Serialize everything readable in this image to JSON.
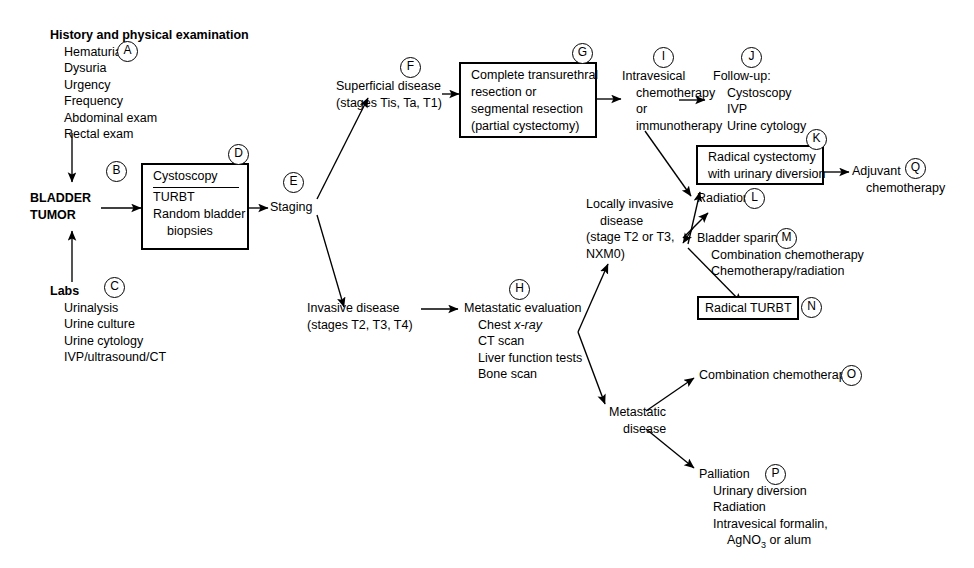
{
  "diagram": {
    "labels": {
      "A": "A",
      "B": "B",
      "C": "C",
      "D": "D",
      "E": "E",
      "F": "F",
      "G": "G",
      "H": "H",
      "I": "I",
      "J": "J",
      "K": "K",
      "L": "L",
      "M": "M",
      "N": "N",
      "O": "O",
      "P": "P",
      "Q": "Q"
    },
    "nodes": {
      "history": {
        "heading": "History and physical examination",
        "items": [
          "Hematuria",
          "Dysuria",
          "Urgency",
          "Frequency",
          "Abdominal exam",
          "Rectal exam"
        ]
      },
      "bladder_tumor": {
        "line1": "BLADDER",
        "line2": "TUMOR"
      },
      "labs": {
        "heading": "Labs",
        "items": [
          "Urinalysis",
          "Urine culture",
          "Urine cytology",
          "IVP/ultrasound/CT"
        ]
      },
      "cystoscopy_box": {
        "line1": "Cystoscopy",
        "line2": "TURBT",
        "line3": "Random bladder",
        "line4": "biopsies"
      },
      "staging": {
        "label": "Staging"
      },
      "superficial": {
        "line1": "Superficial disease",
        "line2": "(stages Tis, Ta, T1)"
      },
      "resection_box": {
        "line1": "Complete transurethral",
        "line2": "resection or",
        "line3": "segmental resection",
        "line4": "(partial cystectomy)"
      },
      "intravesical": {
        "line1": "Intravesical",
        "line2": "chemotherapy",
        "line3": "or",
        "line4": "immunotherapy"
      },
      "followup": {
        "heading": "Follow-up:",
        "items": [
          "Cystoscopy",
          "IVP",
          "Urine cytology"
        ]
      },
      "invasive": {
        "line1": "Invasive disease",
        "line2": "(stages T2, T3, T4)"
      },
      "metastatic_eval": {
        "heading": "Metastatic evaluation",
        "items": [
          "Chest x-ray",
          "CT scan",
          "Liver function tests",
          "Bone scan"
        ],
        "chest_pre": "Chest ",
        "chest_ital": "x-ray"
      },
      "locally_invasive": {
        "line1": "Locally invasive",
        "line2": "disease",
        "line3": "(stage T2 or T3,",
        "line4": "NXM0)"
      },
      "cystectomy_box": {
        "line1": "Radical cystectomy",
        "line2": "with urinary diversion"
      },
      "adjuvant": {
        "line1": "Adjuvant",
        "line2": "chemotherapy"
      },
      "radiation": {
        "label": "Radiation"
      },
      "bladder_sparing": {
        "heading": "Bladder sparing",
        "items": [
          "Combination chemotherapy",
          "Chemotherapy/radiation"
        ]
      },
      "radical_turbt_box": {
        "label": "Radical TURBT"
      },
      "metastatic_disease": {
        "line1": "Metastatic",
        "line2": "disease"
      },
      "combination_chemo": {
        "label": "Combination chemotherapy"
      },
      "palliation": {
        "heading": "Palliation",
        "items": [
          "Urinary diversion",
          "Radiation",
          "Intravesical formalin,"
        ],
        "agno3_pre": "AgNO",
        "agno3_sub": "3",
        "agno3_post": " or alum"
      }
    }
  }
}
